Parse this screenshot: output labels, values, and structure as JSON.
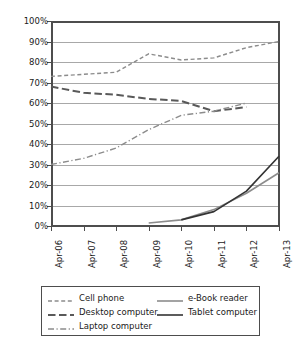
{
  "chart_data": {
    "type": "line",
    "title": "",
    "subtitle": "",
    "xlabel": "",
    "ylabel": "",
    "x": [
      "Apr-06",
      "Apr-07",
      "Apr-08",
      "Apr-09",
      "Apr-10",
      "Apr-11",
      "Apr-12",
      "Apr-13"
    ],
    "categories": [
      "Apr-06",
      "Apr-07",
      "Apr-08",
      "Apr-09",
      "Apr-10",
      "Apr-11",
      "Apr-12",
      "Apr-13"
    ],
    "ylim": [
      0,
      100
    ],
    "yticks": [
      0,
      10,
      20,
      30,
      40,
      50,
      60,
      70,
      80,
      90,
      100
    ],
    "ytick_labels": [
      "0%",
      "10%",
      "20%",
      "30%",
      "40%",
      "50%",
      "60%",
      "70%",
      "80%",
      "90%",
      "100%"
    ],
    "grid": true,
    "legend_position": "bottom",
    "series": [
      {
        "name": "Cell phone",
        "style": "dashed",
        "color": "#8c8c8c",
        "width": 1.4,
        "values": [
          73,
          74,
          75,
          84,
          81,
          82,
          87,
          90
        ]
      },
      {
        "name": "Desktop computer",
        "style": "long-dashed",
        "color": "#595959",
        "width": 2.0,
        "values": [
          68,
          65,
          64,
          62,
          61,
          56,
          58,
          null
        ]
      },
      {
        "name": "Laptop computer",
        "style": "dash-dot",
        "color": "#8c8c8c",
        "width": 1.4,
        "values": [
          30,
          33,
          38,
          47,
          54,
          56,
          60,
          null
        ]
      },
      {
        "name": "e-Book reader",
        "style": "solid",
        "color": "#8c8c8c",
        "width": 1.6,
        "values": [
          null,
          null,
          null,
          1.5,
          3,
          8,
          16,
          26
        ]
      },
      {
        "name": "Tablet computer",
        "style": "solid",
        "color": "#333333",
        "width": 1.6,
        "values": [
          null,
          null,
          null,
          null,
          3,
          7,
          17,
          34
        ]
      }
    ]
  },
  "legend": {
    "columns": [
      [
        "Cell phone",
        "Desktop computer",
        "Laptop computer"
      ],
      [
        "e-Book reader",
        "Tablet computer"
      ]
    ]
  }
}
